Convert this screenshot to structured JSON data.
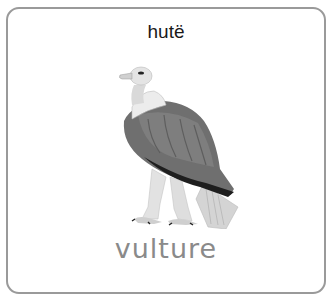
{
  "card": {
    "native_word": "hutë",
    "english_word": "vulture",
    "image": {
      "subject": "vulture-illustration",
      "alt": "vulture"
    }
  },
  "colors": {
    "border": "#9a9a9a",
    "native_text": "#1a1a1a",
    "english_text": "#8a8a8a",
    "bird_body": "#6e6e6e",
    "bird_dark": "#1e1e1e"
  }
}
